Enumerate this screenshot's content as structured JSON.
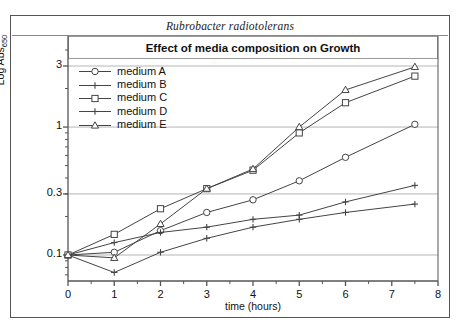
{
  "figure": {
    "species": "Rubrobacter radiotolerans",
    "title": "Effect of media composition on Growth"
  },
  "chart_data": {
    "type": "line",
    "title": "Effect of media composition on Growth",
    "subtitle": "Rubrobacter radiotolerans",
    "xlabel": "time (hours)",
    "ylabel": "Log Abs650",
    "ylabel_base": "Log Abs",
    "ylabel_sub": "650",
    "yscale": "log",
    "xlim": [
      0,
      8
    ],
    "ylim": [
      0.07,
      4
    ],
    "xticks": [
      0,
      1,
      2,
      3,
      4,
      5,
      6,
      7,
      8
    ],
    "xticklabels": [
      "0",
      "1",
      "2",
      "3",
      "4",
      "5",
      "6",
      "7",
      "8"
    ],
    "xminor_step": 0.5,
    "yticks": [
      0.1,
      0.3,
      1,
      3
    ],
    "yticklabels": [
      "0.1",
      "0.3",
      "1",
      "3"
    ],
    "grid": "horizontal-major",
    "legend_position": "upper-left",
    "x": [
      0,
      1,
      2,
      3,
      4,
      5,
      6,
      7.5
    ],
    "series": [
      {
        "name": "medium A",
        "marker": "circle",
        "values": [
          0.1,
          0.105,
          0.155,
          0.215,
          0.27,
          0.38,
          0.58,
          1.05
        ]
      },
      {
        "name": "medium B",
        "marker": "plus",
        "values": [
          0.1,
          0.073,
          0.105,
          0.135,
          0.165,
          0.19,
          0.215,
          0.25
        ]
      },
      {
        "name": "medium C",
        "marker": "square",
        "values": [
          0.1,
          0.145,
          0.23,
          0.33,
          0.46,
          0.9,
          1.55,
          2.5
        ]
      },
      {
        "name": "medium D",
        "marker": "plus",
        "values": [
          0.1,
          0.125,
          0.15,
          0.165,
          0.19,
          0.205,
          0.26,
          0.35
        ]
      },
      {
        "name": "medium E",
        "marker": "triangle",
        "values": [
          0.1,
          0.095,
          0.175,
          0.33,
          0.47,
          1.0,
          1.95,
          2.95
        ]
      }
    ]
  },
  "legend": {
    "items": [
      {
        "label": "medium A"
      },
      {
        "label": "medium B"
      },
      {
        "label": "medium C"
      },
      {
        "label": "medium D"
      },
      {
        "label": "medium E"
      }
    ]
  },
  "colors": {
    "line": "#444444",
    "grid": "#b5b5b5",
    "axis": "#555555",
    "text": "#111111"
  }
}
